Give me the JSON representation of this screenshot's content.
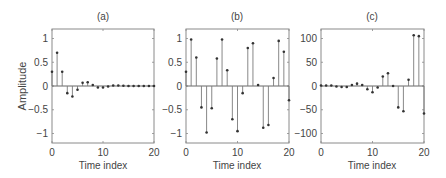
{
  "figure": {
    "ylabel": "Amplitude",
    "xlabel": "Time index"
  },
  "chart_data": [
    {
      "type": "stem",
      "title": "(a)",
      "xlabel": "Time index",
      "ylabel": "Amplitude",
      "xlim": [
        0,
        20
      ],
      "ylim": [
        -1.2,
        1.2
      ],
      "xticks": [
        0,
        10,
        20
      ],
      "yticks": [
        -1,
        -0.5,
        0,
        0.5,
        1
      ],
      "ytick_labels": [
        "-1",
        "-0.5",
        "0",
        "0.5",
        "1"
      ],
      "x": [
        0,
        1,
        2,
        3,
        4,
        5,
        6,
        7,
        8,
        9,
        10,
        11,
        12,
        13,
        14,
        15,
        16,
        17,
        18,
        19,
        20
      ],
      "values": [
        0.3,
        0.7,
        0.3,
        -0.15,
        -0.22,
        -0.08,
        0.07,
        0.08,
        0.02,
        -0.03,
        -0.03,
        -0.01,
        0.01,
        0.01,
        0.005,
        0.0,
        0.0,
        0.0,
        0.0,
        0.0,
        0.0
      ],
      "grid": false
    },
    {
      "type": "stem",
      "title": "(b)",
      "xlabel": "Time index",
      "ylabel": "",
      "xlim": [
        0,
        20
      ],
      "ylim": [
        -1.2,
        1.2
      ],
      "xticks": [
        0,
        10,
        20
      ],
      "yticks": [
        -1,
        -0.5,
        0,
        0.5,
        1
      ],
      "ytick_labels": [
        "-1",
        "-0.5",
        "0",
        "0.5",
        "1"
      ],
      "x": [
        0,
        1,
        2,
        3,
        4,
        5,
        6,
        7,
        8,
        9,
        10,
        11,
        12,
        13,
        14,
        15,
        16,
        17,
        18,
        19,
        20
      ],
      "values": [
        0.3,
        0.98,
        0.6,
        -0.45,
        -0.98,
        -0.47,
        0.58,
        0.98,
        0.33,
        -0.7,
        -0.95,
        -0.15,
        0.8,
        0.9,
        0.02,
        -0.88,
        -0.82,
        0.17,
        0.95,
        0.72,
        -0.3
      ],
      "grid": false
    },
    {
      "type": "stem",
      "title": "(c)",
      "xlabel": "Time index",
      "ylabel": "",
      "xlim": [
        0,
        20
      ],
      "ylim": [
        -120,
        120
      ],
      "xticks": [
        0,
        10,
        20
      ],
      "yticks": [
        -100,
        -50,
        0,
        50,
        100
      ],
      "ytick_labels": [
        "-100",
        "-50",
        "0",
        "50",
        "100"
      ],
      "x": [
        0,
        1,
        2,
        3,
        4,
        5,
        6,
        7,
        8,
        9,
        10,
        11,
        12,
        13,
        14,
        15,
        16,
        17,
        18,
        19,
        20
      ],
      "values": [
        1,
        1,
        1,
        -1,
        -2,
        -2,
        2,
        5,
        2,
        -7,
        -13,
        -3,
        20,
        27,
        0,
        -45,
        -53,
        13,
        107,
        105,
        -58
      ],
      "grid": false
    }
  ],
  "layout": {
    "panels": [
      {
        "left": 52,
        "right": 154
      },
      {
        "left": 186,
        "right": 289
      },
      {
        "left": 321,
        "right": 424
      }
    ],
    "top": 29,
    "bottom": 143,
    "colors": {
      "frame": "#8a8a8a",
      "stem": "#7a7a7a",
      "marker": "#333333",
      "baseline": "#555555"
    }
  }
}
